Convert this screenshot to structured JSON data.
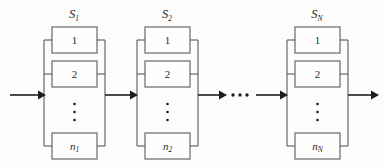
{
  "figure": {
    "type": "reliability-block-diagram",
    "background_color": "#fdfdfc",
    "line_color": "#5a5a5a",
    "arrow_color": "#1d1d1d",
    "text_color": "#2a2a2a"
  },
  "flow": {
    "input_arrow": "input-flow-arrow",
    "output_arrow": "output-flow-arrow",
    "between_arrows": [
      "arrow-s1-to-s2",
      "arrow-s2-to-dots",
      "arrow-dots-to-sn"
    ],
    "continuation_dots": "..."
  },
  "subsystems": [
    {
      "id": "s1",
      "label_base": "S",
      "label_sub": "1",
      "label_full": "S₁",
      "blocks": [
        {
          "id": "s1-b1",
          "label_base": "1",
          "label_sub": "",
          "italic": false
        },
        {
          "id": "s1-b2",
          "label_base": "2",
          "label_sub": "",
          "italic": false
        },
        {
          "id": "s1-bn",
          "label_base": "n",
          "label_sub": "1",
          "italic": true
        }
      ],
      "vertical_dots": "⋮"
    },
    {
      "id": "s2",
      "label_base": "S",
      "label_sub": "2",
      "label_full": "S₂",
      "blocks": [
        {
          "id": "s2-b1",
          "label_base": "1",
          "label_sub": "",
          "italic": false
        },
        {
          "id": "s2-b2",
          "label_base": "2",
          "label_sub": "",
          "italic": false
        },
        {
          "id": "s2-bn",
          "label_base": "n",
          "label_sub": "2",
          "italic": true
        }
      ],
      "vertical_dots": "⋮"
    },
    {
      "id": "sn",
      "label_base": "S",
      "label_sub": "N",
      "label_full": "Sₙ",
      "blocks": [
        {
          "id": "sn-b1",
          "label_base": "1",
          "label_sub": "",
          "italic": false
        },
        {
          "id": "sn-b2",
          "label_base": "2",
          "label_sub": "",
          "italic": false
        },
        {
          "id": "sn-bn",
          "label_base": "n",
          "label_sub": "N",
          "italic": true
        }
      ],
      "vertical_dots": "⋮"
    }
  ]
}
